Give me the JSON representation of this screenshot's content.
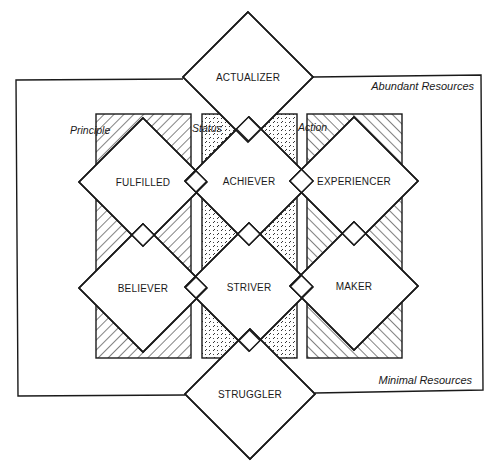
{
  "diagram": {
    "title": "",
    "outer_frame": {
      "top_label": "Abundant Resources",
      "bottom_label": "Minimal Resources"
    },
    "columns": [
      {
        "id": "principle",
        "label": "Principle",
        "pattern": "hatch-forward",
        "x": 96,
        "y": 114,
        "w": 95,
        "h": 244
      },
      {
        "id": "status",
        "label": "Status",
        "pattern": "dashes",
        "x": 202,
        "y": 114,
        "w": 95,
        "h": 244
      },
      {
        "id": "action",
        "label": "Action",
        "pattern": "hatch-back",
        "x": 307,
        "y": 114,
        "w": 95,
        "h": 244
      }
    ],
    "segments": [
      {
        "id": "actualizer",
        "label": "ACTUALIZER",
        "cx": 248,
        "cy": 77,
        "r": 65
      },
      {
        "id": "fulfilled",
        "label": "FULFILLED",
        "cx": 143,
        "cy": 182,
        "r": 64
      },
      {
        "id": "achiever",
        "label": "ACHIEVER",
        "cx": 249,
        "cy": 181,
        "r": 64
      },
      {
        "id": "experiencer",
        "label": "EXPERIENCER",
        "cx": 354,
        "cy": 181,
        "r": 64
      },
      {
        "id": "believer",
        "label": "BELIEVER",
        "cx": 143,
        "cy": 288,
        "r": 64
      },
      {
        "id": "striver",
        "label": "STRIVER",
        "cx": 249,
        "cy": 287,
        "r": 64
      },
      {
        "id": "maker",
        "label": "MAKER",
        "cx": 354,
        "cy": 286,
        "r": 64
      },
      {
        "id": "struggler",
        "label": "STRUGGLER",
        "cx": 250,
        "cy": 394,
        "r": 65
      }
    ],
    "colors": {
      "line": "#1a1a1a",
      "background": "#ffffff"
    }
  }
}
